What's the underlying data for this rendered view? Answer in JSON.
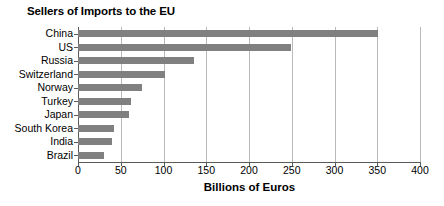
{
  "chart_data": {
    "type": "bar",
    "orientation": "horizontal",
    "title": "Sellers of Imports to the EU",
    "xlabel": "Billions of Euros",
    "ylabel": "",
    "categories": [
      "China",
      "US",
      "Russia",
      "Switzerland",
      "Norway",
      "Turkey",
      "Japan",
      "South Korea",
      "India",
      "Brazil"
    ],
    "values": [
      351,
      249,
      136,
      102,
      75,
      62,
      60,
      42,
      40,
      30
    ],
    "xlim": [
      0,
      400
    ],
    "xticks": [
      0,
      50,
      100,
      150,
      200,
      250,
      300,
      350,
      400
    ],
    "xtick_labels": [
      "0",
      "50",
      "100",
      "150",
      "200",
      "250",
      "300",
      "350",
      "400"
    ],
    "grid": "vertical",
    "legend": "none",
    "bar_color": "#808080",
    "gridline_color": "#b9b9b9",
    "axis_color": "#5a5a5a"
  }
}
